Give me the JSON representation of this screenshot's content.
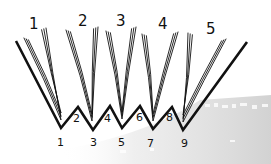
{
  "signatures": [
    {
      "label": "1"
    },
    {
      "label": "2"
    },
    {
      "label": "3"
    },
    {
      "label": "4"
    },
    {
      "label": "5"
    }
  ],
  "fold_labels": {
    "valleys": [
      "1",
      "3",
      "5",
      "7",
      "9"
    ],
    "peaks": [
      "2",
      "4",
      "6",
      "8"
    ]
  },
  "colors": {
    "ink": "#111111",
    "background": "#ffffff",
    "texture": "#d8d8d8"
  }
}
